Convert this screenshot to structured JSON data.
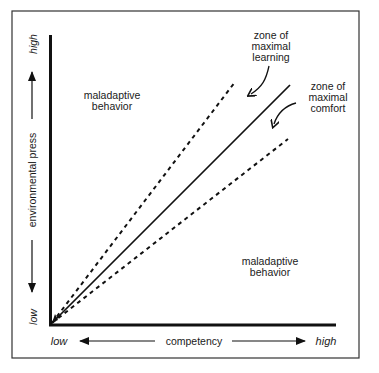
{
  "diagram": {
    "type": "conceptual-graph",
    "x_axis": {
      "label": "competency",
      "low_label": "low",
      "high_label": "high"
    },
    "y_axis": {
      "label": "environmental press",
      "low_label": "low",
      "high_label": "high"
    },
    "regions": {
      "upper_left": "maladaptive behavior",
      "upper_left_lines": [
        "maladaptive",
        "behavior"
      ],
      "lower_right": "maladaptive behavior",
      "lower_right_lines": [
        "maladaptive",
        "behavior"
      ]
    },
    "annotations": {
      "learning": {
        "lines": [
          "zone of",
          "maximal",
          "learning"
        ]
      },
      "comfort": {
        "lines": [
          "zone of",
          "maximal",
          "comfort"
        ]
      }
    },
    "lines": [
      {
        "name": "upper-boundary",
        "style": "dashed"
      },
      {
        "name": "adaptation-level",
        "style": "solid"
      },
      {
        "name": "lower-boundary",
        "style": "dashed"
      }
    ],
    "colors": {
      "ink": "#111111",
      "background": "#ffffff",
      "frame": "#333333"
    }
  }
}
